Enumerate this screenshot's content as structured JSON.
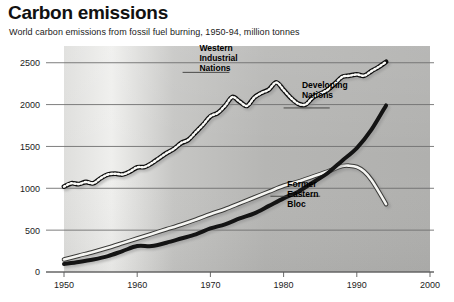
{
  "header": {
    "title": "Carbon emissions",
    "subtitle": "World carbon emissions from fossil fuel burning, 1950-94, million tonnes"
  },
  "colors": {
    "background": "#ffffff",
    "plot_light": "#e9e9e7",
    "plot_dark": "#b0b0ae",
    "gridline": "#6f6f6f",
    "axis": "#5a5a5a",
    "line_dark": "#141414",
    "line_white": "#f5f5f2",
    "text": "#111111"
  },
  "chart_data": {
    "type": "line",
    "title": "Carbon emissions",
    "subtitle": "World carbon emissions from fossil fuel burning, 1950-94, million tonnes",
    "xlabel": "",
    "ylabel": "",
    "xlim": [
      1950,
      2000
    ],
    "ylim": [
      0,
      2700
    ],
    "yticks": [
      0,
      500,
      1000,
      1500,
      2000,
      2500
    ],
    "ytick_labels": [
      "0",
      "500",
      "1000",
      "1500",
      "2000",
      "2500"
    ],
    "xticks": [
      1950,
      1960,
      1970,
      1980,
      1990,
      2000
    ],
    "xtick_labels": [
      "1950",
      "1960",
      "1970",
      "1980",
      "1990",
      "2000"
    ],
    "grid": true,
    "grid_axis": "y",
    "legend": "inline-annotations",
    "units": "million tonnes",
    "series": [
      {
        "name": "Western Industrial Nations",
        "style": "beaded",
        "label_x": 1968.5,
        "label_y": 2640,
        "x": [
          1950,
          1951,
          1952,
          1953,
          1954,
          1955,
          1956,
          1957,
          1958,
          1959,
          1960,
          1961,
          1962,
          1963,
          1964,
          1965,
          1966,
          1967,
          1968,
          1969,
          1970,
          1971,
          1972,
          1973,
          1974,
          1975,
          1976,
          1977,
          1978,
          1979,
          1980,
          1981,
          1982,
          1983,
          1984,
          1985,
          1986,
          1987,
          1988,
          1989,
          1990,
          1991,
          1992,
          1993,
          1994
        ],
        "values": [
          1020,
          1060,
          1050,
          1075,
          1060,
          1120,
          1165,
          1175,
          1165,
          1200,
          1250,
          1255,
          1300,
          1360,
          1420,
          1470,
          1540,
          1580,
          1670,
          1760,
          1860,
          1900,
          1985,
          2090,
          2035,
          1985,
          2085,
          2140,
          2180,
          2265,
          2175,
          2080,
          2010,
          2000,
          2085,
          2130,
          2175,
          2250,
          2330,
          2345,
          2360,
          2345,
          2400,
          2450,
          2510
        ]
      },
      {
        "name": "Developing Nations",
        "style": "thick-black",
        "label_x": 1982.5,
        "label_y": 2195,
        "x": [
          1950,
          1952,
          1954,
          1956,
          1958,
          1960,
          1962,
          1964,
          1966,
          1968,
          1970,
          1972,
          1974,
          1976,
          1978,
          1980,
          1982,
          1984,
          1986,
          1988,
          1990,
          1992,
          1994
        ],
        "values": [
          95,
          120,
          150,
          190,
          250,
          310,
          310,
          350,
          400,
          450,
          520,
          570,
          640,
          700,
          790,
          880,
          960,
          1070,
          1180,
          1330,
          1480,
          1700,
          1990
        ]
      },
      {
        "name": "Former Eastern Bloc",
        "style": "white-outlined",
        "label_x": 1980.5,
        "label_y": 1010,
        "x": [
          1950,
          1952,
          1954,
          1956,
          1958,
          1960,
          1962,
          1964,
          1966,
          1968,
          1970,
          1972,
          1974,
          1976,
          1978,
          1980,
          1982,
          1984,
          1986,
          1988,
          1989,
          1990,
          1991,
          1992,
          1993,
          1994
        ],
        "values": [
          150,
          195,
          240,
          290,
          345,
          400,
          455,
          510,
          565,
          625,
          690,
          750,
          820,
          890,
          960,
          1030,
          1080,
          1140,
          1200,
          1265,
          1270,
          1255,
          1200,
          1100,
          960,
          810
        ]
      }
    ]
  },
  "annotations": [
    {
      "id": "western",
      "lines": [
        "Western",
        "Industrial",
        "Nations"
      ]
    },
    {
      "id": "developing",
      "lines": [
        "Developing",
        "Nations"
      ]
    },
    {
      "id": "eastern",
      "lines": [
        "Former",
        "Eastern",
        "Bloc"
      ]
    }
  ]
}
